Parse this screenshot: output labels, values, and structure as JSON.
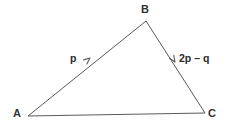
{
  "figure": {
    "type": "vector-triangle-diagram",
    "background_color": "#ffffff",
    "line_color": "#5a5a5a",
    "label_color": "#333333",
    "vector_label_color": "#2b2b2b",
    "width": 228,
    "height": 133
  },
  "vertices": [
    {
      "name": "A",
      "label": "A",
      "x": 28,
      "y": 116,
      "label_x": 13,
      "label_y": 108
    },
    {
      "name": "B",
      "label": "B",
      "x": 146,
      "y": 21,
      "label_x": 141,
      "label_y": 4
    },
    {
      "name": "C",
      "label": "C",
      "x": 205,
      "y": 113,
      "label_x": 208,
      "label_y": 108
    }
  ],
  "edges": [
    {
      "name": "AB",
      "from": "A",
      "to": "B",
      "x1": 28,
      "y1": 116,
      "x2": 146,
      "y2": 21,
      "arrow": true,
      "arrow_direction": "A-to-B",
      "arrow_x": 90,
      "arrow_y": 58
    },
    {
      "name": "BC",
      "from": "B",
      "to": "C",
      "x1": 146,
      "y1": 21,
      "x2": 205,
      "y2": 113,
      "arrow": true,
      "arrow_direction": "B-to-C",
      "arrow_x": 174,
      "arrow_y": 61
    },
    {
      "name": "AC",
      "from": "A",
      "to": "C",
      "x1": 28,
      "y1": 116,
      "x2": 205,
      "y2": 113,
      "arrow": false
    }
  ],
  "vector_labels": [
    {
      "name": "p",
      "edge": "AB",
      "text": "p",
      "x": 70,
      "y": 53
    },
    {
      "name": "2p-minus-q",
      "edge": "BC",
      "text": "2p – q",
      "x": 179,
      "y": 53
    }
  ]
}
